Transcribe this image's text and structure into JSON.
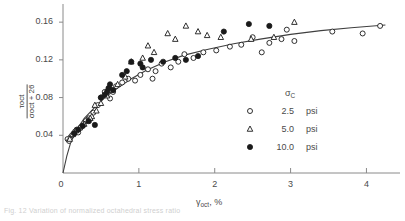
{
  "figure": {
    "caption_partial": "Fig. 12  Variation of normalized octahedral stress ratio"
  },
  "axes": {
    "y": {
      "label_numerator": "τoct",
      "label_denominator": "σoct + 26",
      "ticks": [
        "0.04",
        "0.08",
        "0.12",
        "0.16"
      ],
      "tick_values": [
        0.04,
        0.08,
        0.12,
        0.16
      ],
      "min": 0,
      "max": 0.175
    },
    "x": {
      "label_symbol": "γ",
      "label_sub": "oct",
      "label_units": ", %",
      "origin_label": "0",
      "ticks": [
        "1",
        "2",
        "3",
        "4"
      ],
      "tick_values": [
        1,
        2,
        3,
        4
      ],
      "min": 0,
      "max": 4.35
    }
  },
  "legend": {
    "title_symbol": "σ",
    "title_sub": "C",
    "entries": [
      {
        "marker": "open-circle",
        "value": "2.5",
        "unit": "psi"
      },
      {
        "marker": "open-triangle",
        "value": "5.0",
        "unit": "psi"
      },
      {
        "marker": "filled-circle",
        "value": "10.0",
        "unit": "psi"
      }
    ]
  },
  "colors": {
    "ink": "#4a4a4a",
    "axis": "#8a8a8a",
    "curve": "#3f3f3f",
    "marker_fill": "#1a1a1a"
  },
  "chart_data": {
    "type": "scatter",
    "title": "",
    "xlabel": "γoct , %",
    "ylabel": "τoct / (σoct + 26)",
    "xlim": [
      0,
      4.35
    ],
    "ylim": [
      0,
      0.175
    ],
    "grid": false,
    "legend_position": "right-middle",
    "series": [
      {
        "name": "2.5 psi",
        "marker": "open-circle",
        "points": [
          [
            0.06,
            0.036
          ],
          [
            0.08,
            0.034
          ],
          [
            0.1,
            0.038
          ],
          [
            0.12,
            0.04
          ],
          [
            0.14,
            0.042
          ],
          [
            0.16,
            0.044
          ],
          [
            0.18,
            0.046
          ],
          [
            0.2,
            0.043
          ],
          [
            0.23,
            0.048
          ],
          [
            0.26,
            0.05
          ],
          [
            0.3,
            0.055
          ],
          [
            0.34,
            0.058
          ],
          [
            0.4,
            0.064
          ],
          [
            0.46,
            0.072
          ],
          [
            0.5,
            0.08
          ],
          [
            0.55,
            0.086
          ],
          [
            0.62,
            0.079
          ],
          [
            0.7,
            0.092
          ],
          [
            0.78,
            0.096
          ],
          [
            0.86,
            0.1
          ],
          [
            0.95,
            0.098
          ],
          [
            1.02,
            0.104
          ],
          [
            1.12,
            0.11
          ],
          [
            1.22,
            0.108
          ],
          [
            1.3,
            0.116
          ],
          [
            1.42,
            0.112
          ],
          [
            1.52,
            0.118
          ],
          [
            1.6,
            0.126
          ],
          [
            1.72,
            0.122
          ],
          [
            1.85,
            0.128
          ],
          [
            2.02,
            0.13
          ],
          [
            2.2,
            0.134
          ],
          [
            2.35,
            0.136
          ],
          [
            2.5,
            0.144
          ],
          [
            2.62,
            0.128
          ],
          [
            2.72,
            0.138
          ],
          [
            2.95,
            0.152
          ],
          [
            3.05,
            0.14
          ],
          [
            3.55,
            0.15
          ],
          [
            3.95,
            0.148
          ],
          [
            4.18,
            0.156
          ],
          [
            2.88,
            0.142
          ],
          [
            1.18,
            0.1
          ],
          [
            0.66,
            0.086
          ]
        ]
      },
      {
        "name": "5.0 psi",
        "marker": "open-triangle",
        "points": [
          [
            0.09,
            0.036
          ],
          [
            0.13,
            0.041
          ],
          [
            0.17,
            0.045
          ],
          [
            0.22,
            0.048
          ],
          [
            0.28,
            0.052
          ],
          [
            0.33,
            0.056
          ],
          [
            0.38,
            0.06
          ],
          [
            0.44,
            0.066
          ],
          [
            0.5,
            0.074
          ],
          [
            0.58,
            0.082
          ],
          [
            0.64,
            0.088
          ],
          [
            0.72,
            0.094
          ],
          [
            0.82,
            0.102
          ],
          [
            0.9,
            0.118
          ],
          [
            1.05,
            0.122
          ],
          [
            1.2,
            0.128
          ],
          [
            1.38,
            0.148
          ],
          [
            1.48,
            0.142
          ],
          [
            1.62,
            0.156
          ],
          [
            1.78,
            0.15
          ],
          [
            1.9,
            0.146
          ],
          [
            2.08,
            0.144
          ],
          [
            2.48,
            0.142
          ],
          [
            2.78,
            0.144
          ],
          [
            3.05,
            0.16
          ],
          [
            0.42,
            0.072
          ],
          [
            0.36,
            0.058
          ],
          [
            1.12,
            0.135
          ]
        ]
      },
      {
        "name": "10.0 psi",
        "marker": "filled-circle",
        "points": [
          [
            0.15,
            0.042
          ],
          [
            0.2,
            0.046
          ],
          [
            0.26,
            0.05
          ],
          [
            0.34,
            0.055
          ],
          [
            0.42,
            0.051
          ],
          [
            0.55,
            0.083
          ],
          [
            0.58,
            0.086
          ],
          [
            0.6,
            0.09
          ],
          [
            0.62,
            0.094
          ],
          [
            0.66,
            0.088
          ],
          [
            0.78,
            0.104
          ],
          [
            0.9,
            0.118
          ],
          [
            1.02,
            0.116
          ],
          [
            1.16,
            0.12
          ],
          [
            1.32,
            0.118
          ],
          [
            1.48,
            0.122
          ],
          [
            1.62,
            0.12
          ],
          [
            1.78,
            0.124
          ],
          [
            2.12,
            0.15
          ],
          [
            2.45,
            0.158
          ],
          [
            2.72,
            0.156
          ],
          [
            1.05,
            0.112
          ],
          [
            0.84,
            0.108
          ],
          [
            0.5,
            0.08
          ]
        ]
      }
    ],
    "fit_curve": {
      "name": "hyperbolic fit",
      "description": "rising hyperbolic curve through origin",
      "points": [
        [
          0.0,
          0.0
        ],
        [
          0.05,
          0.018
        ],
        [
          0.1,
          0.032
        ],
        [
          0.18,
          0.046
        ],
        [
          0.28,
          0.058
        ],
        [
          0.4,
          0.068
        ],
        [
          0.55,
          0.08
        ],
        [
          0.72,
          0.09
        ],
        [
          0.9,
          0.1
        ],
        [
          1.1,
          0.109
        ],
        [
          1.35,
          0.118
        ],
        [
          1.6,
          0.125
        ],
        [
          1.9,
          0.131
        ],
        [
          2.25,
          0.137
        ],
        [
          2.6,
          0.142
        ],
        [
          3.0,
          0.147
        ],
        [
          3.4,
          0.151
        ],
        [
          3.8,
          0.154
        ],
        [
          4.25,
          0.157
        ]
      ]
    }
  }
}
